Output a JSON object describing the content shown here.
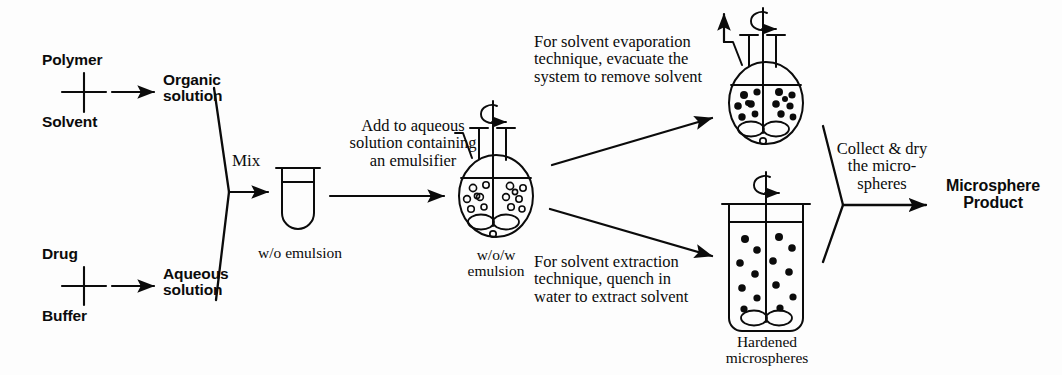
{
  "diagram": {
    "ink_color": "#0b0b0b",
    "background": "#fdfdfd",
    "inputs": {
      "organic": {
        "component_a": "Polymer",
        "component_b": "Solvent",
        "plus": "+",
        "result": "Organic\nsolution"
      },
      "aqueous": {
        "component_a": "Drug",
        "component_b": "Buffer",
        "plus": "+",
        "result": "Aqueous\nsolution"
      }
    },
    "steps": {
      "mix": "Mix",
      "wo_emulsion_caption": "w/o emulsion",
      "add_to_aqueous": "Add to aqueous\nsolution containing\nan emulsifier",
      "wow_emulsion_caption": "w/o/w\nemulsion",
      "evaporation_branch": "For solvent evaporation\ntechnique, evacuate the\nsystem to remove solvent",
      "extraction_branch": "For solvent extraction\ntechnique, quench in\nwater to extract solvent",
      "hardened_caption": "Hardened\nmicrospheres",
      "collect_and_dry": "Collect & dry\nthe micro-\nspheres"
    },
    "output": {
      "label": "Microsphere\nProduct"
    },
    "vessels": {
      "test_tube": {
        "name": "w/o emulsion test tube",
        "contents": "emulsion liquid"
      },
      "wow_flask": {
        "name": "w/o/w three-neck round-bottom flask",
        "droplets": "open circles",
        "stirrer": "rotating paddle"
      },
      "evaporation_flask": {
        "name": "three-neck round-bottom flask under vacuum",
        "droplets": "filled circles",
        "stirrer": "rotating paddle",
        "vent": "vacuum arrow"
      },
      "quench_beaker": {
        "name": "quench beaker",
        "droplets": "filled circles",
        "stirrer": "rotating paddle"
      }
    }
  }
}
